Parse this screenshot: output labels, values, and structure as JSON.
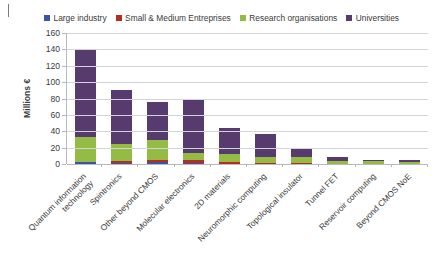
{
  "chart_data": {
    "type": "bar",
    "subtype": "stacked-column",
    "title": "",
    "xlabel": "",
    "ylabel": "Millions €",
    "ylim": [
      0,
      160
    ],
    "ytick_step": 20,
    "yticks": [
      160,
      140,
      120,
      100,
      80,
      60,
      40,
      20,
      0
    ],
    "grid": "horizontal",
    "legend_position": "top",
    "categories": [
      "Quantum information technology",
      "Spintronics",
      "Other beyond CMOS",
      "Molecular electronics",
      "2D materials",
      "Neuromorphic computing",
      "Topological insulator",
      "Tunnel FET",
      "Reservoir computing",
      "Beyond CMOS NoE"
    ],
    "series": [
      {
        "name": "Large industry",
        "color": "#3b55a4",
        "values": [
          2.0,
          1.0,
          2.5,
          1.0,
          0.5,
          0.5,
          0.5,
          0.3,
          0.2,
          0.3
        ]
      },
      {
        "name": "Small & Medium Entreprises",
        "color": "#b62c1e",
        "values": [
          0.5,
          3.0,
          3.0,
          4.0,
          1.5,
          1.0,
          0.5,
          0.3,
          0.2,
          0.3
        ]
      },
      {
        "name": "Research organisations",
        "color": "#94bb43",
        "values": [
          30.5,
          20.0,
          23.5,
          9.0,
          10.0,
          6.5,
          8.0,
          3.4,
          3.6,
          1.9
        ]
      },
      {
        "name": "Universities",
        "color": "#573b6e",
        "values": [
          107.0,
          66.0,
          47.0,
          66.0,
          32.0,
          29.0,
          10.0,
          4.0,
          1.5,
          2.5
        ]
      }
    ],
    "totals": [
      140,
      90,
      76,
      80,
      44,
      37,
      19,
      8,
      5.5,
      5
    ]
  },
  "legend": {
    "items": [
      {
        "label": "Large industry",
        "color": "#3b55a4"
      },
      {
        "label": "Small & Medium Entreprises",
        "color": "#b62c1e"
      },
      {
        "label": "Research organisations",
        "color": "#94bb43"
      },
      {
        "label": "Universities",
        "color": "#573b6e"
      }
    ]
  }
}
